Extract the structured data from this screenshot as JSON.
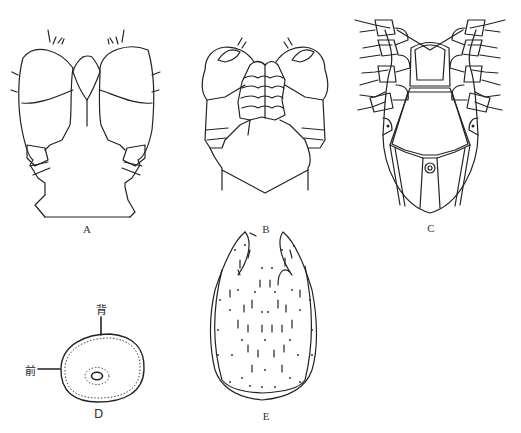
{
  "figure": {
    "panels": [
      {
        "id": "A",
        "label": "A",
        "description": "capitulum dorsal view"
      },
      {
        "id": "B",
        "label": "B",
        "description": "capitulum ventral view"
      },
      {
        "id": "C",
        "label": "C",
        "description": "ventral view with legs"
      },
      {
        "id": "D",
        "label": "D",
        "description": "spiracular plate"
      },
      {
        "id": "E",
        "label": "E",
        "description": "scutum with setae"
      }
    ],
    "annotations": {
      "dorsal": "背",
      "anterior": "前"
    }
  }
}
